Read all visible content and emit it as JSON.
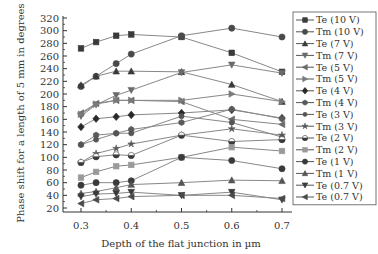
{
  "chart_data": {
    "type": "line",
    "title": "",
    "xlabel": "Depth of the flat junction in µm",
    "ylabel": "Phase shift for a length of 5 mm in degrees",
    "xlim": [
      0.3,
      0.7
    ],
    "ylim": [
      20,
      320
    ],
    "xticks": [
      0.3,
      0.4,
      0.5,
      0.6,
      0.7
    ],
    "xtick_labels": [
      "0.3",
      "0.4",
      "0.5",
      "0.6",
      "0.7"
    ],
    "yticks": [
      20,
      40,
      60,
      80,
      100,
      120,
      140,
      160,
      180,
      200,
      220,
      240,
      260,
      280,
      300,
      320
    ],
    "ytick_labels": [
      "20",
      "40",
      "60",
      "80",
      "100",
      "120",
      "140",
      "160",
      "180",
      "200",
      "220",
      "240",
      "260",
      "280",
      "300",
      "320"
    ],
    "grid": false,
    "legend_position": "right",
    "x": [
      0.3,
      0.33,
      0.37,
      0.4,
      0.5,
      0.6,
      0.7
    ],
    "series": [
      {
        "name": "Te (10 V)",
        "marker": "square",
        "color": "#3a3a3a",
        "values": [
          272,
          282,
          292,
          294,
          290,
          265,
          235
        ]
      },
      {
        "name": "Tm (10 V)",
        "marker": "circle",
        "color": "#4a4a4a",
        "values": [
          212,
          228,
          248,
          263,
          292,
          304,
          290
        ]
      },
      {
        "name": "Te (7 V)",
        "marker": "triangle-up",
        "color": "#3a3a3a",
        "values": [
          214,
          228,
          236,
          236,
          235,
          215,
          188
        ]
      },
      {
        "name": "Tm (7 V)",
        "marker": "triangle-down",
        "color": "#6a6a6a",
        "values": [
          165,
          183,
          198,
          206,
          234,
          246,
          233
        ]
      },
      {
        "name": "Te (5 V)",
        "marker": "triangle-left",
        "color": "#6a6a6a",
        "values": [
          170,
          185,
          190,
          190,
          188,
          160,
          152
        ]
      },
      {
        "name": "Tm (5 V)",
        "marker": "triangle-right",
        "color": "#7a7a7a",
        "values": [
          168,
          184,
          190,
          190,
          190,
          200,
          188
        ]
      },
      {
        "name": "Te (4 V)",
        "marker": "diamond",
        "color": "#2a2a2a",
        "values": [
          148,
          161,
          164,
          167,
          170,
          175,
          162
        ]
      },
      {
        "name": "Tm (4 V)",
        "marker": "hexagon",
        "color": "#5a5a5a",
        "values": [
          120,
          135,
          138,
          144,
          155,
          176,
          161
        ]
      },
      {
        "name": "Te (3 V)",
        "marker": "circle-small",
        "color": "#555555",
        "values": [
          120,
          128,
          138,
          138,
          165,
          155,
          132
        ]
      },
      {
        "name": "Tm (3 V)",
        "marker": "star",
        "color": "#555555",
        "values": [
          92,
          106,
          114,
          121,
          135,
          145,
          135
        ]
      },
      {
        "name": "Te (2 V)",
        "marker": "half-circle",
        "color": "#3a3a3a",
        "values": [
          92,
          101,
          104,
          103,
          135,
          125,
          128
        ]
      },
      {
        "name": "Tm (2 V)",
        "marker": "square",
        "color": "#9a9a9a",
        "values": [
          68,
          77,
          86,
          88,
          100,
          116,
          110
        ]
      },
      {
        "name": "Te (1 V)",
        "marker": "circle",
        "color": "#3a3a3a",
        "values": [
          56,
          60,
          60,
          63,
          100,
          95,
          82
        ]
      },
      {
        "name": "Tm (1 V)",
        "marker": "triangle-up",
        "color": "#555555",
        "values": [
          43,
          46,
          52,
          57,
          60,
          64,
          63
        ]
      },
      {
        "name": "Te (0.7 V)",
        "marker": "triangle-down",
        "color": "#3a3a3a",
        "values": [
          38,
          42,
          43,
          45,
          40,
          45,
          33
        ]
      },
      {
        "name": "Te (0.7 V)",
        "marker": "triangle-left",
        "color": "#4a4a4a",
        "values": [
          27,
          33,
          35,
          38,
          40,
          40,
          35
        ]
      }
    ]
  },
  "colors": {
    "axis": "#333333",
    "line": "#888888",
    "legend_border": "#555555"
  }
}
